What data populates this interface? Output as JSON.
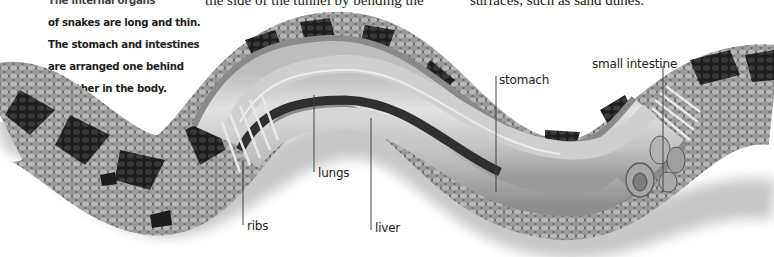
{
  "page": {
    "top_text_fragments": [
      "the side of the tunnel by bending the",
      "surfaces, such as sand dunes."
    ],
    "caption": {
      "lines": [
        "The internal organs",
        "of snakes are long and thin.",
        "The stomach and intestines",
        "are arranged one behind",
        "the other in the body."
      ]
    }
  },
  "illustration": {
    "subject": "snake-cutaway",
    "palette": {
      "scale_dark": "#2a2a2a",
      "scale_mid": "#6e6e6e",
      "scale_light": "#c9c9c9",
      "organ_light": "#d8d8d8",
      "organ_mid": "#a9a9a9",
      "liver_dark": "#3a3a3a",
      "leader_line": "#444444"
    },
    "labels": [
      {
        "id": "stomach",
        "text": "stomach"
      },
      {
        "id": "small-intestine",
        "text": "small intestine"
      },
      {
        "id": "lungs",
        "text": "lungs"
      },
      {
        "id": "ribs",
        "text": "ribs"
      },
      {
        "id": "liver",
        "text": "liver"
      }
    ]
  }
}
